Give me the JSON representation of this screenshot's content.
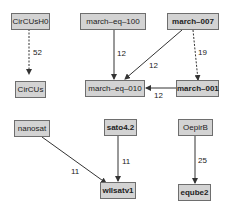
{
  "diagram": {
    "title": "",
    "colors": {
      "node_fill": "#d3d3d3",
      "node_border": "#6e6e6e",
      "edge": "#333333",
      "text": "#222222"
    },
    "nodes": [
      {
        "id": "CirCUsH0",
        "label": "CirCUsH0",
        "bold": false
      },
      {
        "id": "CirCUs",
        "label": "CirCUs",
        "bold": false
      },
      {
        "id": "march-eq-100",
        "label": "march–eq–100",
        "bold": false
      },
      {
        "id": "march-007",
        "label": "march–007",
        "bold": true
      },
      {
        "id": "march-eq-010",
        "label": "march–eq–010",
        "bold": false
      },
      {
        "id": "march-001",
        "label": "march–001",
        "bold": true
      },
      {
        "id": "nanosat",
        "label": "nanosat",
        "bold": false
      },
      {
        "id": "sato4.2",
        "label": "sato4.2",
        "bold": true
      },
      {
        "id": "OepirB",
        "label": "OepirB",
        "bold": false
      },
      {
        "id": "wllsatv1",
        "label": "wllsatv1",
        "bold": true
      },
      {
        "id": "eqube2",
        "label": "eqube2",
        "bold": true
      }
    ],
    "edges": [
      {
        "from": "CirCUsH0",
        "to": "CirCUs",
        "label": "52",
        "style": "dashed"
      },
      {
        "from": "march-eq-100",
        "to": "march-eq-010",
        "label": "12",
        "style": "solid"
      },
      {
        "from": "march-007",
        "to": "march-eq-010",
        "label": "12",
        "style": "solid"
      },
      {
        "from": "march-007",
        "to": "march-001",
        "label": "19",
        "style": "dashed"
      },
      {
        "from": "march-001",
        "to": "march-eq-010",
        "label": "12",
        "style": "solid"
      },
      {
        "from": "nanosat",
        "to": "wllsatv1",
        "label": "11",
        "style": "solid"
      },
      {
        "from": "sato4.2",
        "to": "wllsatv1",
        "label": "11",
        "style": "solid"
      },
      {
        "from": "OepirB",
        "to": "eqube2",
        "label": "25",
        "style": "solid"
      }
    ]
  }
}
